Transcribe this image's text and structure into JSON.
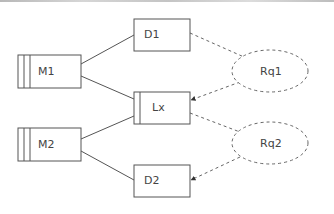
{
  "diagram": {
    "colors": {
      "stroke": "#555555",
      "dashed": "#666666",
      "text": "#444444",
      "background": "#ffffff"
    },
    "nodes": [
      {
        "id": "M1",
        "label": "M1",
        "shape": "rect-striped",
        "stripes": 2
      },
      {
        "id": "M2",
        "label": "M2",
        "shape": "rect-striped",
        "stripes": 2
      },
      {
        "id": "D1",
        "label": "D1",
        "shape": "rect"
      },
      {
        "id": "Lx",
        "label": "Lx",
        "shape": "rect-striped",
        "stripes": 1
      },
      {
        "id": "D2",
        "label": "D2",
        "shape": "rect"
      },
      {
        "id": "Rq1",
        "label": "Rq1",
        "shape": "ellipse-dashed"
      },
      {
        "id": "Rq2",
        "label": "Rq2",
        "shape": "ellipse-dashed"
      }
    ],
    "edges": [
      {
        "from": "M1",
        "to": "D1",
        "style": "solid"
      },
      {
        "from": "M1",
        "to": "Lx",
        "style": "solid"
      },
      {
        "from": "M2",
        "to": "Lx",
        "style": "solid"
      },
      {
        "from": "M2",
        "to": "D2",
        "style": "solid"
      },
      {
        "from": "D1",
        "to": "Rq1",
        "style": "dashed"
      },
      {
        "from": "Rq1",
        "to": "Lx",
        "style": "dashed-arrow"
      },
      {
        "from": "Lx",
        "to": "Rq2",
        "style": "dashed"
      },
      {
        "from": "Rq2",
        "to": "D2",
        "style": "dashed-arrow"
      }
    ]
  }
}
